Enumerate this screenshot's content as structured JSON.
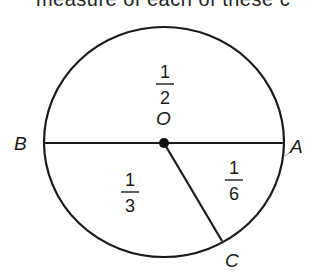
{
  "caption": "measure of each of these c",
  "diagram": {
    "center": {
      "label": "O",
      "x": 164,
      "y": 143
    },
    "points": {
      "A": {
        "label": "A"
      },
      "B": {
        "label": "B"
      },
      "C": {
        "label": "C"
      }
    },
    "regions": [
      {
        "name": "upper-half",
        "numerator": "1",
        "denominator": "2"
      },
      {
        "name": "lower-left",
        "numerator": "1",
        "denominator": "3"
      },
      {
        "name": "lower-right",
        "numerator": "1",
        "denominator": "6"
      }
    ],
    "colors": {
      "stroke": "#1a1a1a",
      "background": "#ffffff"
    }
  }
}
